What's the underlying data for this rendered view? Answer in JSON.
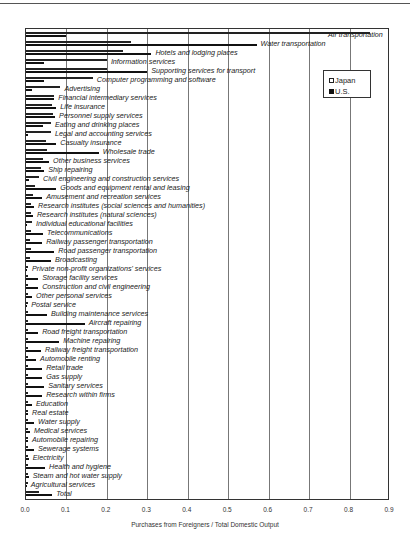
{
  "chart_data": {
    "type": "bar",
    "orientation": "horizontal",
    "title": "",
    "xlabel": "Purchases from Foreigners / Total Domestic Output",
    "ylabel": "",
    "xlim": [
      0,
      0.9
    ],
    "xticks": [
      "0.0",
      "0.1",
      "0.2",
      "0.3",
      "0.4",
      "0.5",
      "0.6",
      "0.7",
      "0.8",
      "0.9"
    ],
    "grid": true,
    "legend_position": "upper right",
    "legend": [
      "Japan",
      "U.S."
    ],
    "categories": [
      "Air transportation",
      "Water transportation",
      "Hotels and lodging places",
      "Information services",
      "Supporting services for transport",
      "Computer programming and software",
      "Advertising",
      "Financial intermediary services",
      "Life insurance",
      "Personnel supply services",
      "Eating and drinking places",
      "Legal and accounting services",
      "Casualty insurance",
      "Wholesale trade",
      "Other business services",
      "Ship repairing",
      "Civil engineering and construction services",
      "Goods and equipment rental and leasing",
      "Amusement and recreation services",
      "Research institutes (social sciences and humanities)",
      "Research institutes (natural sciences)",
      "Individual educational facilities",
      "Telecommunications",
      "Railway passenger transportation",
      "Road passenger transportation",
      "Broadcasting",
      "Private non-profit organizations' services",
      "Storage facility services",
      "Construction and civil engineering",
      "Other personal services",
      "Postal service",
      "Building maintenance services",
      "Aircraft repairing",
      "Road freight transportation",
      "Machine repairing",
      "Railway freight transportation",
      "Automobile renting",
      "Retail trade",
      "Gas supply",
      "Sanitary services",
      "Research within firms",
      "Education",
      "Real estate",
      "Water supply",
      "Medical services",
      "Automobile repairing",
      "Sewerage systems",
      "Electricity",
      "Health and hygiene",
      "Steam and hot water supply",
      "Agricultural services",
      "Total"
    ],
    "series": [
      {
        "name": "Japan",
        "values": [
          0.85,
          0.26,
          0.24,
          0.2,
          0.2,
          0.165,
          0.085,
          0.07,
          0.065,
          0.067,
          0.062,
          0.062,
          0.05,
          0.052,
          0.042,
          0.037,
          0.032,
          0.022,
          0.017,
          0.012,
          0.012,
          0.015,
          0.012,
          0.01,
          0.012,
          0.01,
          0.005,
          0.005,
          0.003,
          0.003,
          0.003,
          0.003,
          0.003,
          0.002,
          0.002,
          0.002,
          0.002,
          0.002,
          0.002,
          0.002,
          0.002,
          0.002,
          0.002,
          0.002,
          0.002,
          0.002,
          0.002,
          0.002,
          0.002,
          0.002,
          0.002,
          0.032
        ]
      },
      {
        "name": "U.S.",
        "values": [
          0.1,
          0.57,
          0.31,
          0.045,
          0.3,
          0.045,
          0.015,
          0.07,
          0.075,
          0.072,
          0.042,
          0.005,
          0.075,
          0.18,
          0.057,
          0.045,
          0.007,
          0.075,
          0.04,
          0.02,
          0.017,
          0.002,
          0.042,
          0.04,
          0.07,
          0.062,
          0.002,
          0.03,
          0.03,
          0.015,
          0.002,
          0.052,
          0.145,
          0.03,
          0.082,
          0.037,
          0.025,
          0.04,
          0.04,
          0.045,
          0.04,
          0.015,
          0.005,
          0.02,
          0.01,
          0.005,
          0.02,
          0.007,
          0.047,
          0.007,
          0.002,
          0.065
        ]
      }
    ]
  },
  "labels": {
    "xlabel": "Purchases from Foreigners / Total Domestic Output",
    "legend_japan": "Japan",
    "legend_us": "U.S."
  },
  "label_offsets": [
    362,
    4,
    4,
    4,
    4,
    4,
    4,
    4,
    4,
    4,
    4,
    4,
    4,
    4,
    4,
    4,
    4,
    4,
    4,
    4,
    4,
    4,
    4,
    4,
    4,
    4,
    4,
    4,
    4,
    4,
    4,
    4,
    4,
    4,
    4,
    4,
    4,
    4,
    4,
    4,
    4,
    4,
    4,
    4,
    4,
    4,
    4,
    4,
    4,
    4,
    4,
    4
  ]
}
